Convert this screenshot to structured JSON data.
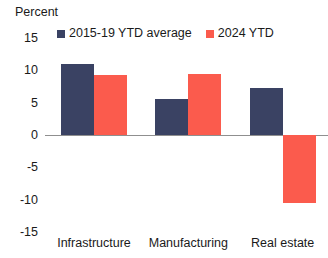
{
  "chart_data": {
    "type": "bar",
    "title": "",
    "subtitle": "",
    "xlabel": "",
    "ylabel": "Percent",
    "ylim": [
      -15,
      15
    ],
    "yticks": [
      15,
      10,
      5,
      0,
      -5,
      -10,
      -15
    ],
    "ytick_labels": [
      "15",
      "10",
      "5",
      "0",
      "-5",
      "-10",
      "-15"
    ],
    "grid": false,
    "zero_line": true,
    "legend_position": "top",
    "categories": [
      "Infrastructure",
      "Manufacturing",
      "Real estate"
    ],
    "series": [
      {
        "name": "2015-19 YTD average",
        "color": "#3a4263",
        "values": [
          11.0,
          5.6,
          7.2
        ]
      },
      {
        "name": "2024 YTD",
        "color": "#fb5b4d",
        "values": [
          9.3,
          9.4,
          -10.5
        ]
      }
    ]
  },
  "axis": {
    "unit_label": "Percent"
  },
  "colors": {
    "series_1": "#3a4263",
    "series_2": "#fb5b4d",
    "zero_line": "#8f8f8f",
    "text": "#1a1a1a",
    "background": "#ffffff"
  }
}
